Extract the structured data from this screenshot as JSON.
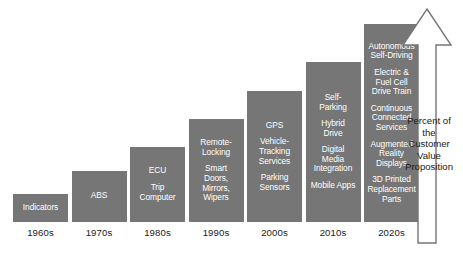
{
  "chart_data": {
    "type": "bar",
    "title": "",
    "xlabel": "",
    "ylabel": "Percent of the Customer Value Proposition",
    "grid": false,
    "legend": "none",
    "ylim": [
      0,
      100
    ],
    "categories": [
      "1960s",
      "1970s",
      "1980s",
      "1990s",
      "2000s",
      "2010s",
      "2020s"
    ],
    "values": [
      14,
      26,
      38,
      52,
      66,
      81,
      100
    ],
    "bars": [
      {
        "category": "1960s",
        "value": 14,
        "features": [
          "Indicators"
        ]
      },
      {
        "category": "1970s",
        "value": 26,
        "features": [
          "ABS"
        ]
      },
      {
        "category": "1980s",
        "value": 38,
        "features": [
          "ECU",
          "Trip\nComputer"
        ]
      },
      {
        "category": "1990s",
        "value": 52,
        "features": [
          "Remote-\nLocking",
          "Smart\nDoors,\nMirrors,\nWipers"
        ]
      },
      {
        "category": "2000s",
        "value": 66,
        "features": [
          "GPS",
          "Vehicle-\nTracking\nServices",
          "Parking\nSensors"
        ]
      },
      {
        "category": "2010s",
        "value": 81,
        "features": [
          "Self-\nParking",
          "Hybrid\nDrive",
          "Digital\nMedia\nIntegration",
          "Mobile Apps"
        ]
      },
      {
        "category": "2020s",
        "value": 100,
        "features": [
          "Autonomous\nSelf-Driving",
          "Electric &\nFuel Cell\nDrive Train",
          "Continuous\nConnected\nServices",
          "Augmented\nReality\nDisplays",
          "3D Printed\nReplacement\nParts"
        ]
      }
    ]
  },
  "axis": {
    "arrow_caption": "Percent of\nthe\nCustomer\nValue\nProposition"
  },
  "colors": {
    "bar_fill": "#767676",
    "bar_text": "#ffffff",
    "tick_text": "#1a1a1a",
    "arrow_stroke": "#767676",
    "arrow_fill": "#ffffff",
    "background": "#ffffff"
  }
}
